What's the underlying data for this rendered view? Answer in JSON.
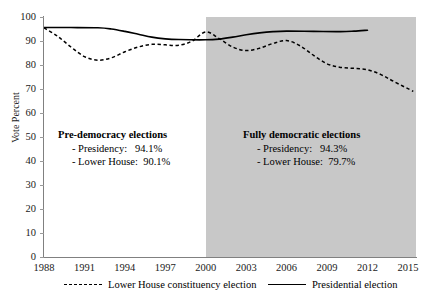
{
  "chart_data": {
    "type": "line",
    "title": "",
    "xlabel": "",
    "ylabel": "Vote Percent",
    "xlim": [
      1988,
      2015.6
    ],
    "ylim": [
      0,
      100
    ],
    "ytick_step": 10,
    "yticks": [
      0,
      10,
      20,
      30,
      40,
      50,
      60,
      70,
      80,
      90,
      100
    ],
    "xticks": [
      1988,
      1991,
      1994,
      1997,
      2000,
      2003,
      2006,
      2009,
      2012,
      2015
    ],
    "grid": false,
    "legend_position": "bottom",
    "shaded_region": {
      "label": "Fully democratic elections",
      "x_start": 2000,
      "x_end": 2015.6,
      "color": "#c8c8c8"
    },
    "series": [
      {
        "name": "Lower House constituency election",
        "style": "dashed",
        "color": "#000000",
        "points": [
          {
            "x": 1988,
            "y": 95.5
          },
          {
            "x": 1989,
            "y": 92.0
          },
          {
            "x": 1990,
            "y": 87.5
          },
          {
            "x": 1991,
            "y": 83.5
          },
          {
            "x": 1992,
            "y": 82.0
          },
          {
            "x": 1993,
            "y": 83.0
          },
          {
            "x": 1994,
            "y": 85.5
          },
          {
            "x": 1995,
            "y": 87.5
          },
          {
            "x": 1996,
            "y": 88.6
          },
          {
            "x": 1997,
            "y": 88.4
          },
          {
            "x": 1998,
            "y": 88.2
          },
          {
            "x": 1999,
            "y": 90.0
          },
          {
            "x": 2000,
            "y": 93.8
          },
          {
            "x": 2001,
            "y": 91.0
          },
          {
            "x": 2002,
            "y": 87.5
          },
          {
            "x": 2003,
            "y": 86.0
          },
          {
            "x": 2004,
            "y": 87.0
          },
          {
            "x": 2005,
            "y": 89.0
          },
          {
            "x": 2006,
            "y": 90.2
          },
          {
            "x": 2007,
            "y": 88.0
          },
          {
            "x": 2008,
            "y": 84.0
          },
          {
            "x": 2009,
            "y": 80.5
          },
          {
            "x": 2010,
            "y": 79.0
          },
          {
            "x": 2011,
            "y": 78.6
          },
          {
            "x": 2012,
            "y": 78.0
          },
          {
            "x": 2013,
            "y": 76.0
          },
          {
            "x": 2014,
            "y": 73.0
          },
          {
            "x": 2015.4,
            "y": 69.0
          }
        ]
      },
      {
        "name": "Presidential election",
        "style": "solid",
        "color": "#000000",
        "points": [
          {
            "x": 1988,
            "y": 95.6
          },
          {
            "x": 1990,
            "y": 95.6
          },
          {
            "x": 1992,
            "y": 95.5
          },
          {
            "x": 1993,
            "y": 95.0
          },
          {
            "x": 1994,
            "y": 94.0
          },
          {
            "x": 1995,
            "y": 92.8
          },
          {
            "x": 1996,
            "y": 91.6
          },
          {
            "x": 1997,
            "y": 90.9
          },
          {
            "x": 1998,
            "y": 90.6
          },
          {
            "x": 2000,
            "y": 90.5
          },
          {
            "x": 2001,
            "y": 90.8
          },
          {
            "x": 2002,
            "y": 91.6
          },
          {
            "x": 2003,
            "y": 92.6
          },
          {
            "x": 2004,
            "y": 93.4
          },
          {
            "x": 2005,
            "y": 93.9
          },
          {
            "x": 2006,
            "y": 94.1
          },
          {
            "x": 2008,
            "y": 94.0
          },
          {
            "x": 2010,
            "y": 93.9
          },
          {
            "x": 2011,
            "y": 94.1
          },
          {
            "x": 2012,
            "y": 94.5
          }
        ]
      }
    ],
    "annotations": [
      {
        "id": "pre-democracy",
        "heading": "Pre-democracy elections",
        "lines": [
          {
            "label": "- Presidency:",
            "value": "94.1%"
          },
          {
            "label": "- Lower House:",
            "value": "90.1%"
          }
        ]
      },
      {
        "id": "fully-democratic",
        "heading": "Fully democratic elections",
        "lines": [
          {
            "label": "- Presidency:",
            "value": "94.3%"
          },
          {
            "label": "- Lower House:",
            "value": "79.7%"
          }
        ]
      }
    ]
  },
  "axis": {
    "ylabel": "Vote Percent",
    "ytick_labels": [
      "0",
      "10",
      "20",
      "30",
      "40",
      "50",
      "60",
      "70",
      "80",
      "90",
      "100"
    ],
    "xtick_labels": [
      "1988",
      "1991",
      "1994",
      "1997",
      "2000",
      "2003",
      "2006",
      "2009",
      "2012",
      "2015"
    ]
  },
  "legend": {
    "items": [
      {
        "label": "Lower House constituency election",
        "style": "dashed"
      },
      {
        "label": "Presidential election",
        "style": "solid"
      }
    ]
  }
}
